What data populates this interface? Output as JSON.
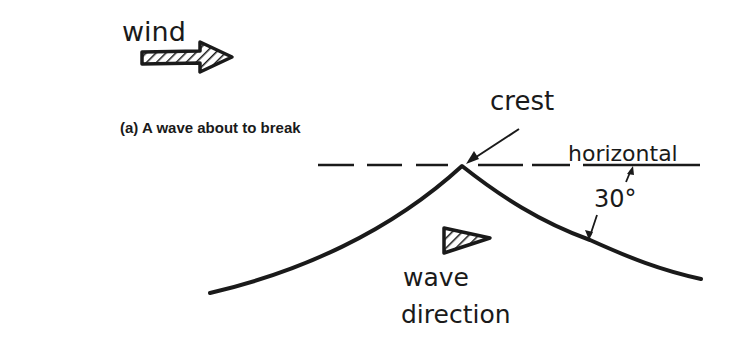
{
  "diagram": {
    "caption": "(a) A wave about to break",
    "labels": {
      "wind": "wind",
      "crest": "crest",
      "horizontal": "horizontal",
      "angle": "30°",
      "wave_line1": "wave",
      "wave_line2": "direction"
    },
    "colors": {
      "ink": "#1a1a1a",
      "background": "#ffffff"
    }
  }
}
